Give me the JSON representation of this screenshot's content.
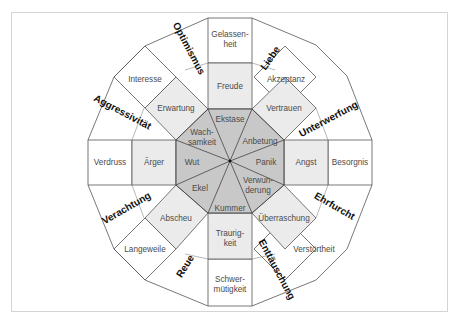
{
  "diagram": {
    "colors": {
      "inner": "#c8c8c8",
      "middle": "#ebebeb",
      "outer": "#ffffff",
      "line": "#555555",
      "frame": "#d4d4d4"
    },
    "inner_ring": {
      "ekstase": "Ekstase",
      "anbetung": "Anbetung",
      "panik": "Panik",
      "verwunderung_1": "Verwun-",
      "verwunderung_2": "derung",
      "kummer": "Kummer",
      "ekel": "Ekel",
      "wut": "Wut",
      "wachsamkeit_1": "Wach-",
      "wachsamkeit_2": "samkeit"
    },
    "middle_ring": {
      "freude": "Freude",
      "vertrauen": "Vertrauen",
      "angst": "Angst",
      "ueberraschung": "Überraschung",
      "traurigkeit_1": "Traurig-",
      "traurigkeit_2": "keit",
      "abscheu": "Abscheu",
      "aerger": "Ärger",
      "erwartung": "Erwartung"
    },
    "outer_ring": {
      "gelassenheit_1": "Gelassen-",
      "gelassenheit_2": "heit",
      "akzeptanz": "Akzeptanz",
      "besorgnis": "Besorgnis",
      "verstoertheit": "Verstörtheit",
      "schwermuetigkeit_1": "Schwer-",
      "schwermuetigkeit_2": "mütigkeit",
      "langeweile": "Langeweile",
      "verdruss": "Verdruss",
      "interesse": "Interesse"
    },
    "dyads": {
      "optimismus": "Optimismus",
      "liebe": "Liebe",
      "unterwerfung": "Unterwerfung",
      "ehrfurcht": "Ehrfurcht",
      "enttaeuschung": "Enttäuschung",
      "reue": "Reue",
      "verachtung": "Verachtung",
      "aggressivitaet": "Aggressivität"
    }
  }
}
